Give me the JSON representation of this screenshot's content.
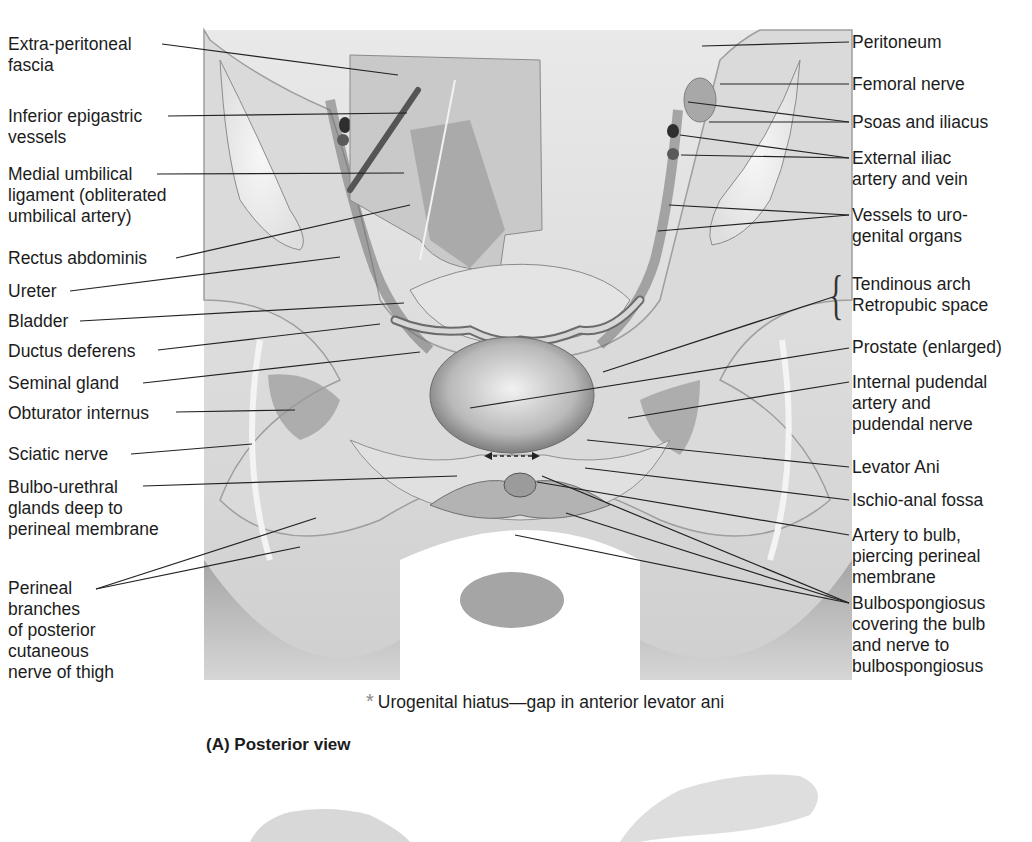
{
  "figure": {
    "caption": "(A) Posterior view",
    "footnote_marker": "*",
    "footnote_text": "Urogenital hiatus—gap in anterior levator ani",
    "palette": {
      "background": "#ffffff",
      "ink": "#1c1c1c",
      "tissue_light": "#e6e6e6",
      "tissue_mid": "#bdbdbd",
      "tissue_dark": "#7a7a7a",
      "footnote_star": "#8a8a8a"
    }
  },
  "labels_left": [
    {
      "id": "extra-peritoneal-fascia",
      "text": [
        "Extra-peritoneal",
        "fascia"
      ]
    },
    {
      "id": "inferior-epigastric-vessels",
      "text": [
        "Inferior epigastric",
        "vessels"
      ]
    },
    {
      "id": "medial-umbilical-ligament",
      "text": [
        "Medial umbilical",
        "ligament (obliterated",
        "umbilical artery)"
      ]
    },
    {
      "id": "rectus-abdominis",
      "text": [
        "Rectus abdominis"
      ]
    },
    {
      "id": "ureter",
      "text": [
        "Ureter"
      ]
    },
    {
      "id": "bladder",
      "text": [
        "Bladder"
      ]
    },
    {
      "id": "ductus-deferens",
      "text": [
        "Ductus deferens"
      ]
    },
    {
      "id": "seminal-gland",
      "text": [
        "Seminal gland"
      ]
    },
    {
      "id": "obturator-internus",
      "text": [
        "Obturator internus"
      ]
    },
    {
      "id": "sciatic-nerve",
      "text": [
        "Sciatic nerve"
      ]
    },
    {
      "id": "bulbo-urethral-glands",
      "text": [
        "Bulbo-urethral",
        "glands deep to",
        "perineal membrane"
      ]
    },
    {
      "id": "perineal-branches",
      "text": [
        "Perineal",
        "branches",
        "of posterior",
        "cutaneous",
        "nerve of thigh"
      ]
    }
  ],
  "labels_right": [
    {
      "id": "peritoneum",
      "text": [
        "Peritoneum"
      ]
    },
    {
      "id": "femoral-nerve",
      "text": [
        "Femoral nerve"
      ]
    },
    {
      "id": "psoas-and-iliacus",
      "text": [
        "Psoas and iliacus"
      ]
    },
    {
      "id": "external-iliac",
      "text": [
        "External iliac",
        "artery and vein"
      ]
    },
    {
      "id": "vessels-urogenital",
      "text": [
        "Vessels to uro-",
        "genital organs"
      ]
    },
    {
      "id": "tendinous-arch",
      "text": [
        "Tendinous arch",
        "Retropubic space"
      ]
    },
    {
      "id": "prostate",
      "text": [
        "Prostate (enlarged)"
      ]
    },
    {
      "id": "internal-pudendal",
      "text": [
        "Internal pudendal",
        "artery and",
        "pudendal nerve"
      ]
    },
    {
      "id": "levator-ani",
      "text": [
        "Levator Ani"
      ]
    },
    {
      "id": "ischio-anal-fossa",
      "text": [
        "Ischio-anal fossa"
      ]
    },
    {
      "id": "artery-to-bulb",
      "text": [
        "Artery to bulb,",
        "piercing perineal",
        "membrane"
      ]
    },
    {
      "id": "bulbospongiosus",
      "text": [
        "Bulbospongiosus",
        "covering the bulb",
        "and nerve to",
        "bulbospongiosus"
      ]
    }
  ]
}
